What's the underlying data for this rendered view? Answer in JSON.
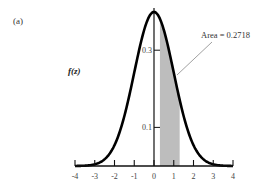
{
  "panel_label": "(a)",
  "chart_data": {
    "type": "area",
    "title": "",
    "xlabel": "",
    "ylabel": "f(z)",
    "xlim": [
      -4,
      4
    ],
    "ylim": [
      0,
      0.4
    ],
    "x_ticks": [
      -4,
      -3,
      -2,
      -1,
      0,
      1,
      2,
      3,
      4
    ],
    "x_tick_labels": [
      "-4",
      "-3",
      "-2",
      "-1",
      "0",
      "1",
      "2",
      "3",
      "4"
    ],
    "y_ticks": [
      0.1,
      0.3
    ],
    "y_tick_labels": [
      "0.1",
      "0.3"
    ],
    "series": [
      {
        "name": "standard normal density f(z)",
        "function": "exp(-z^2/2)/sqrt(2*pi)"
      }
    ],
    "shaded_region": {
      "from": 0.3,
      "to": 1.3,
      "area": 0.2718
    },
    "annotations": [
      {
        "text": "Area = 0.2718",
        "arrow_to": "shaded region"
      }
    ],
    "grid": false,
    "legend": "none"
  },
  "annotation_text": "Area = 0.2718",
  "colors": {
    "curve": "#000000",
    "shade": "#bdbdbd",
    "axis": "#111111"
  }
}
